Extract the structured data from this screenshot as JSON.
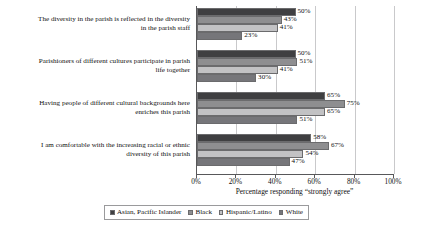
{
  "chart_data": {
    "type": "bar",
    "orientation": "horizontal",
    "grouped": true,
    "title": "",
    "xlabel": "Percentage responding “strongly agree”",
    "ylabel": "",
    "xlim": [
      0,
      100
    ],
    "xticks": [
      "0%",
      "20%",
      "40%",
      "60%",
      "80%",
      "100%"
    ],
    "xtick_values": [
      0,
      20,
      40,
      60,
      80,
      100
    ],
    "grid": true,
    "grid_axis": "x",
    "legend_position": "bottom",
    "value_label_suffix": "%",
    "categories": [
      "The diversity in the parish is reflected in the diversity in the parish staff",
      "Parishioners of different cultures participate in parish life together",
      "Having people of different cultural backgrounds here enriches this parish",
      "I am comfortable with the increasing racial or ethnic diversity of this parish"
    ],
    "category_lines": [
      [
        "The diversity in the parish is reflected in the diversity",
        "in the parish staff"
      ],
      [
        "Parishioners of different cultures participate in parish",
        "life together"
      ],
      [
        "Having people of different cultural backgrounds here",
        "enriches this parish"
      ],
      [
        "I am comfortable with the increasing racial or ethnic",
        "diversity of this parish"
      ]
    ],
    "series": [
      {
        "name": "Asian, Pacific Islander",
        "color": "#3f3f41",
        "values": [
          50,
          50,
          65,
          58
        ],
        "labels": [
          "50%",
          "50%",
          "65%",
          "58%"
        ]
      },
      {
        "name": "Black",
        "color": "#8e8e90",
        "values": [
          43,
          51,
          75,
          67
        ],
        "labels": [
          "43%",
          "51%",
          "75%",
          "67%"
        ]
      },
      {
        "name": "Hispanic/Latino",
        "color": "#c2c2c4",
        "values": [
          41,
          41,
          65,
          54
        ],
        "labels": [
          "41%",
          "41%",
          "65%",
          "54%"
        ]
      },
      {
        "name": "White",
        "color": "#76767a",
        "values": [
          23,
          30,
          51,
          47
        ],
        "labels": [
          "23%",
          "30%",
          "51%",
          "47%"
        ]
      }
    ]
  },
  "legend": {
    "items": [
      {
        "label": "Asian, Pacific Islander",
        "color": "#3f3f41"
      },
      {
        "label": "Black",
        "color": "#8e8e90"
      },
      {
        "label": "Hispanic/Latino",
        "color": "#c2c2c4"
      },
      {
        "label": "White",
        "color": "#76767a"
      }
    ]
  },
  "axis": {
    "x_title": "Percentage responding “strongly agree”",
    "ticks": [
      "0%",
      "20%",
      "40%",
      "60%",
      "80%",
      "100%"
    ]
  }
}
